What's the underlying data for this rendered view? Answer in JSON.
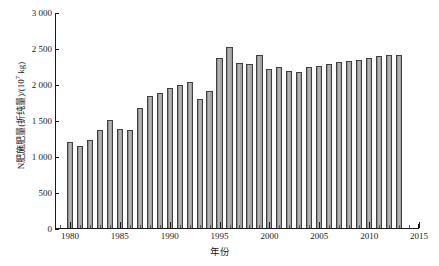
{
  "chart_data": {
    "type": "bar",
    "title": "",
    "xlabel": "年份",
    "ylabel": "N肥施肥量(折纯量)/(10⁷ kg)",
    "ylabel_prefix": "N肥施肥量(折纯量)/(10",
    "ylabel_exponent": "7",
    "ylabel_suffix": " kg)",
    "xlim": [
      1978.5,
      2015.0
    ],
    "ylim": [
      0,
      3000
    ],
    "grid": false,
    "legend": null,
    "bar_color": "#a0a0a0",
    "bar_edge_color": "#404040",
    "axis_color": "#1a1a1a",
    "background_color": "#ffffff",
    "ytick_labels": [
      "0",
      "500",
      "1 000",
      "1 500",
      "2 000",
      "2 500",
      "3 000"
    ],
    "ytick_values": [
      0,
      500,
      1000,
      1500,
      2000,
      2500,
      3000
    ],
    "xtick_labels": [
      "1980",
      "1985",
      "1990",
      "1995",
      "2000",
      "2005",
      "2010",
      "2015"
    ],
    "xtick_values": [
      1980,
      1985,
      1990,
      1995,
      2000,
      2005,
      2010,
      2015
    ],
    "categories": [
      1980,
      1981,
      1982,
      1983,
      1984,
      1985,
      1986,
      1987,
      1988,
      1989,
      1990,
      1991,
      1992,
      1993,
      1994,
      1995,
      1996,
      1997,
      1998,
      1999,
      2000,
      2001,
      2002,
      2003,
      2004,
      2005,
      2006,
      2007,
      2008,
      2009,
      2010,
      2011,
      2012,
      2013
    ],
    "values": [
      1210,
      1150,
      1230,
      1380,
      1520,
      1390,
      1370,
      1680,
      1850,
      1890,
      1960,
      2000,
      2040,
      1800,
      1920,
      2380,
      2530,
      2300,
      2290,
      2420,
      2220,
      2250,
      2190,
      2180,
      2250,
      2260,
      2290,
      2320,
      2330,
      2350,
      2380,
      2400,
      2420,
      2420
    ]
  }
}
